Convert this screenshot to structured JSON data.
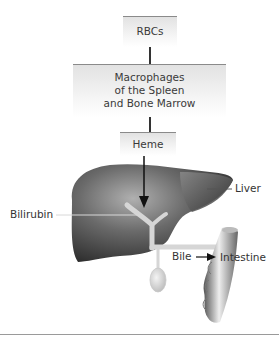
{
  "diagram": {
    "type": "flow with anatomical illustration",
    "boxes": [
      {
        "id": "rbcs",
        "lines": [
          "RBCs"
        ]
      },
      {
        "id": "macrophages",
        "lines": [
          "Macrophages",
          "of the Spleen",
          "and Bone Marrow"
        ]
      },
      {
        "id": "heme",
        "lines": [
          "Heme"
        ]
      }
    ],
    "labels": {
      "liver": "Liver",
      "bilirubin": "Bilirubin",
      "bile": "Bile",
      "intestine": "Intestine"
    },
    "colors": {
      "box_top_border": "#8a8a8a",
      "organ_dark": "#3a3a3a",
      "organ_light": "#a8a8a8",
      "duct": "#d8d8d8"
    }
  }
}
